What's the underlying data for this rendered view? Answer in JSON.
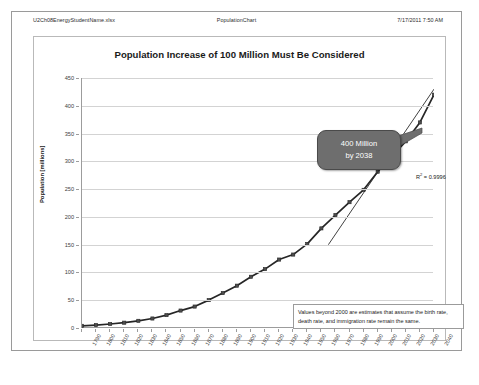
{
  "header": {
    "left": "U2Ch08EnergyStudentName.xlsx",
    "center": "PopulationChart",
    "right": "7/17/2011 7:50 AM"
  },
  "callout": {
    "line1": "400  Million",
    "line2": "by 2038"
  },
  "note": {
    "text": "Values beyond 2000 are estimates that assume the birth rate, death rate, and immigration rate remain the same."
  },
  "r2": {
    "prefix": "R",
    "sup": "2",
    "suffix": " = 0.9996"
  },
  "colors": {
    "series": "#262626",
    "callout_fill": "#6e6e6e",
    "gridline": "#d3d3d3",
    "axis": "#9c9c9c",
    "frame": "#9a9a9a"
  },
  "chart_data": {
    "type": "line",
    "title": "Population Increase of 100 Million Must Be Considered",
    "xlabel": "",
    "ylabel": "Population [millions]",
    "xlim": [
      1790,
      2040
    ],
    "ylim": [
      0,
      450
    ],
    "ytick_step": 50,
    "xtick_step": 10,
    "grid": true,
    "legend": "none",
    "marker": "square",
    "annotations": [
      "400  Million by 2038",
      "R2 = 0.9996",
      "Values beyond 2000 are estimates that assume the birth rate, death rate, and immigration rate remain the same."
    ],
    "yticks": [
      0,
      50,
      100,
      150,
      200,
      250,
      300,
      350,
      400,
      450
    ],
    "xticks": [
      1790,
      1800,
      1810,
      1820,
      1830,
      1840,
      1850,
      1860,
      1870,
      1880,
      1890,
      1900,
      1910,
      1920,
      1930,
      1940,
      1950,
      1960,
      1970,
      1980,
      1990,
      2000,
      2010,
      2020,
      2030,
      2040
    ],
    "series": [
      {
        "name": "Population",
        "x": [
          1790,
          1800,
          1810,
          1820,
          1830,
          1840,
          1850,
          1860,
          1870,
          1880,
          1890,
          1900,
          1910,
          1920,
          1930,
          1940,
          1950,
          1960,
          1970,
          1980,
          1990,
          2000,
          2010,
          2020,
          2030,
          2040
        ],
        "values": [
          3.9,
          5.3,
          7.2,
          9.6,
          12.9,
          17.1,
          23.2,
          31.4,
          38.6,
          50.2,
          62.9,
          76.2,
          92.2,
          106.0,
          123.2,
          132.2,
          151.3,
          179.3,
          203.3,
          226.5,
          248.7,
          281.4,
          308.7,
          336.0,
          370.0,
          420.0
        ]
      }
    ]
  }
}
